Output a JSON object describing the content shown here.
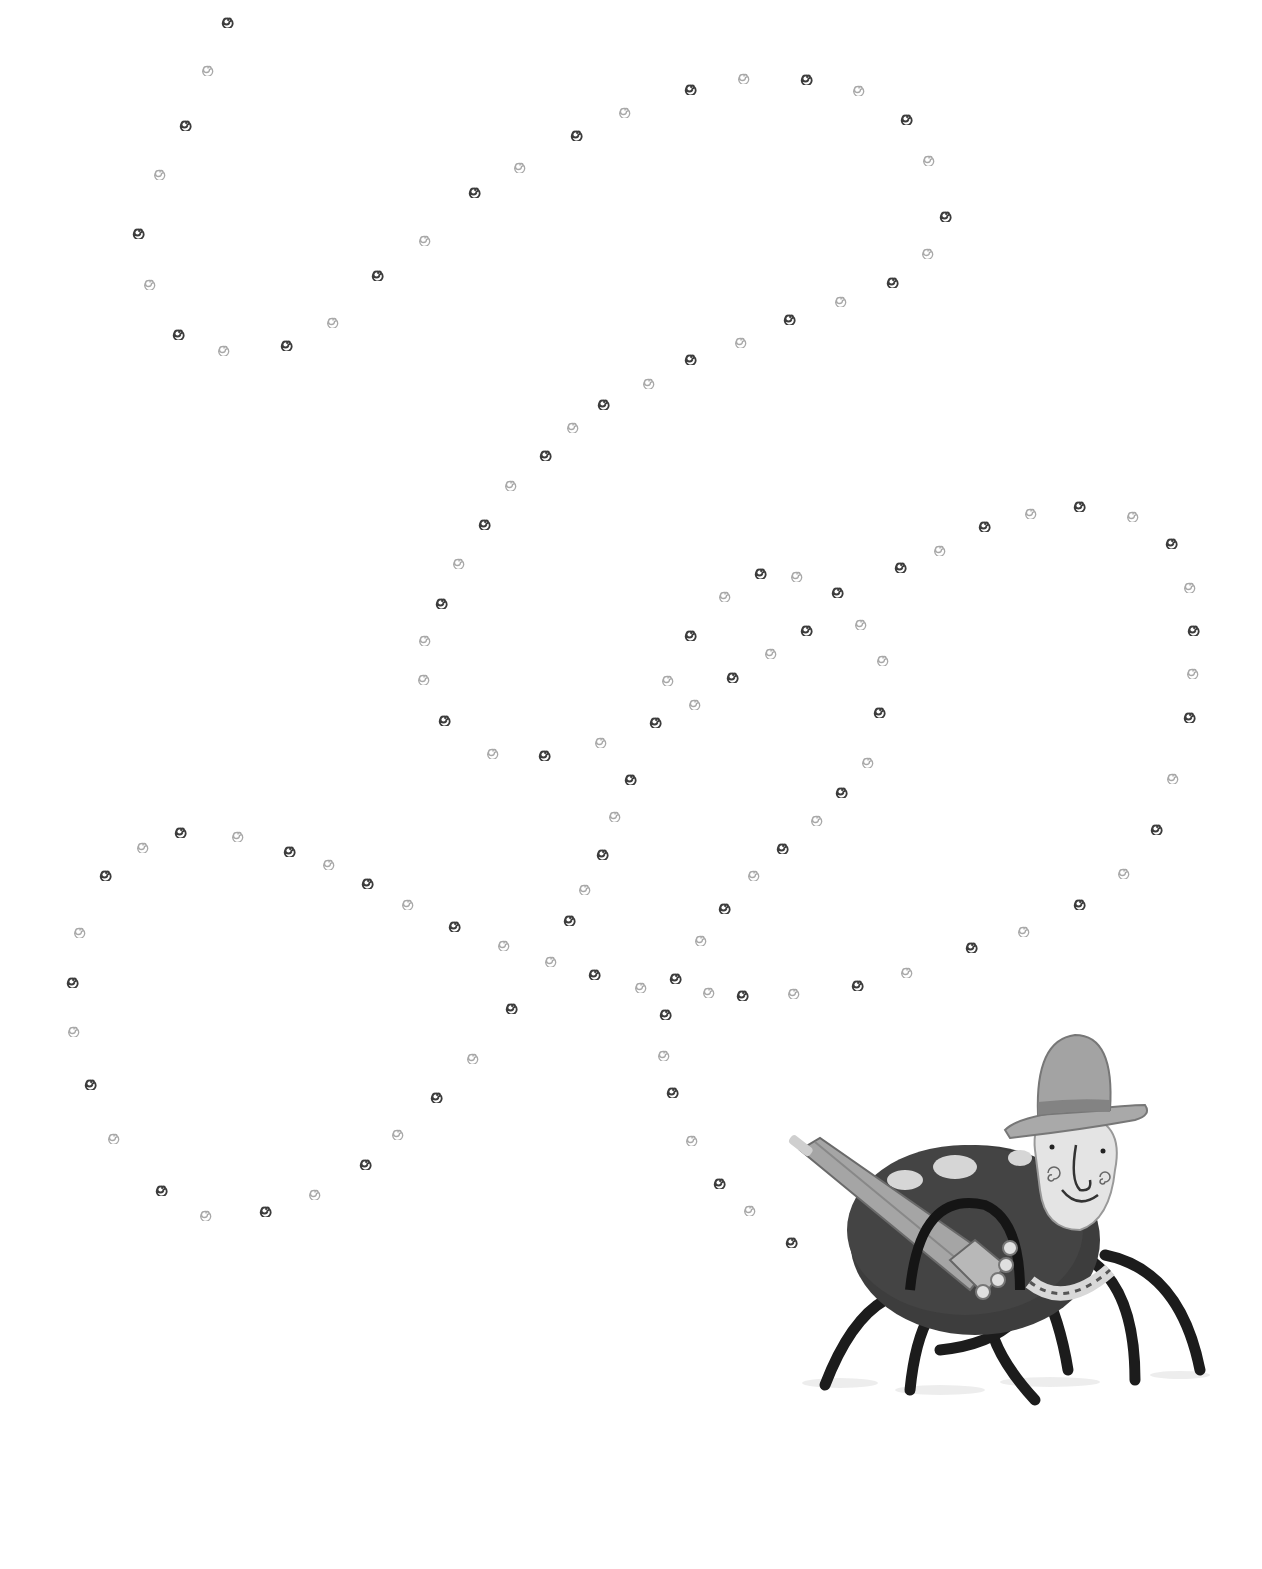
{
  "page": {
    "width": 1262,
    "height": 1569,
    "background": "#ffffff"
  },
  "illustration": {
    "subject": "spider wearing a bowler hat and holding a closed umbrella",
    "style": "grayscale painted children's book illustration",
    "colors": {
      "body": "#3a3a3a",
      "spots": "#d8d8d8",
      "legs": "#1a1a1a",
      "face": "#e6e6e6",
      "hat": "#9a9a9a",
      "hat_band": "#7a7a7a",
      "umbrella": "#9c9c9c"
    }
  },
  "trail": {
    "icon": "spiral-icon",
    "dark_color": "#3c3c3c",
    "light_color": "#a8a8a8",
    "points": [
      [
        228,
        20,
        1
      ],
      [
        208,
        68,
        0
      ],
      [
        186,
        123,
        1
      ],
      [
        160,
        172,
        0
      ],
      [
        139,
        231,
        1
      ],
      [
        150,
        282,
        0
      ],
      [
        179,
        332,
        1
      ],
      [
        224,
        348,
        0
      ],
      [
        287,
        343,
        1
      ],
      [
        333,
        320,
        0
      ],
      [
        378,
        273,
        1
      ],
      [
        425,
        238,
        0
      ],
      [
        475,
        190,
        1
      ],
      [
        520,
        165,
        0
      ],
      [
        577,
        133,
        1
      ],
      [
        625,
        110,
        0
      ],
      [
        691,
        87,
        1
      ],
      [
        744,
        76,
        0
      ],
      [
        807,
        77,
        1
      ],
      [
        859,
        88,
        0
      ],
      [
        907,
        117,
        1
      ],
      [
        929,
        158,
        0
      ],
      [
        946,
        214,
        1
      ],
      [
        928,
        251,
        0
      ],
      [
        893,
        280,
        1
      ],
      [
        841,
        299,
        0
      ],
      [
        790,
        317,
        1
      ],
      [
        741,
        340,
        0
      ],
      [
        691,
        357,
        1
      ],
      [
        649,
        381,
        0
      ],
      [
        604,
        402,
        1
      ],
      [
        573,
        425,
        0
      ],
      [
        546,
        453,
        1
      ],
      [
        511,
        483,
        0
      ],
      [
        485,
        522,
        1
      ],
      [
        459,
        561,
        0
      ],
      [
        442,
        601,
        1
      ],
      [
        425,
        638,
        0
      ],
      [
        424,
        677,
        0
      ],
      [
        445,
        718,
        1
      ],
      [
        493,
        751,
        0
      ],
      [
        545,
        753,
        1
      ],
      [
        601,
        740,
        0
      ],
      [
        656,
        720,
        1
      ],
      [
        695,
        702,
        0
      ],
      [
        733,
        675,
        1
      ],
      [
        771,
        651,
        0
      ],
      [
        807,
        628,
        1
      ],
      [
        861,
        622,
        0
      ],
      [
        838,
        590,
        1
      ],
      [
        797,
        574,
        0
      ],
      [
        761,
        571,
        1
      ],
      [
        725,
        594,
        0
      ],
      [
        691,
        633,
        1
      ],
      [
        668,
        678,
        0
      ],
      [
        631,
        777,
        1
      ],
      [
        615,
        814,
        0
      ],
      [
        603,
        852,
        1
      ],
      [
        585,
        887,
        0
      ],
      [
        570,
        918,
        1
      ],
      [
        551,
        959,
        0
      ],
      [
        512,
        1006,
        1
      ],
      [
        473,
        1056,
        0
      ],
      [
        437,
        1095,
        1
      ],
      [
        398,
        1132,
        0
      ],
      [
        366,
        1162,
        1
      ],
      [
        315,
        1192,
        0
      ],
      [
        266,
        1209,
        1
      ],
      [
        206,
        1213,
        0
      ],
      [
        162,
        1188,
        1
      ],
      [
        114,
        1136,
        0
      ],
      [
        91,
        1082,
        1
      ],
      [
        74,
        1029,
        0
      ],
      [
        73,
        980,
        1
      ],
      [
        80,
        930,
        0
      ],
      [
        106,
        873,
        1
      ],
      [
        143,
        845,
        0
      ],
      [
        181,
        830,
        1
      ],
      [
        238,
        834,
        0
      ],
      [
        290,
        849,
        1
      ],
      [
        329,
        862,
        0
      ],
      [
        368,
        881,
        1
      ],
      [
        408,
        902,
        0
      ],
      [
        455,
        924,
        1
      ],
      [
        504,
        943,
        0
      ],
      [
        595,
        972,
        1
      ],
      [
        641,
        985,
        0
      ],
      [
        676,
        976,
        1
      ],
      [
        709,
        990,
        0
      ],
      [
        743,
        993,
        1
      ],
      [
        794,
        991,
        0
      ],
      [
        858,
        983,
        1
      ],
      [
        907,
        970,
        0
      ],
      [
        972,
        945,
        1
      ],
      [
        1024,
        929,
        0
      ],
      [
        1080,
        902,
        1
      ],
      [
        1124,
        871,
        0
      ],
      [
        1157,
        827,
        1
      ],
      [
        1173,
        776,
        0
      ],
      [
        1190,
        715,
        1
      ],
      [
        1193,
        671,
        0
      ],
      [
        1194,
        628,
        1
      ],
      [
        1190,
        585,
        0
      ],
      [
        1172,
        541,
        1
      ],
      [
        1133,
        514,
        0
      ],
      [
        1080,
        504,
        1
      ],
      [
        1031,
        511,
        0
      ],
      [
        985,
        524,
        1
      ],
      [
        940,
        548,
        0
      ],
      [
        901,
        565,
        1
      ],
      [
        883,
        658,
        0
      ],
      [
        880,
        710,
        1
      ],
      [
        868,
        760,
        0
      ],
      [
        842,
        790,
        1
      ],
      [
        817,
        818,
        0
      ],
      [
        783,
        846,
        1
      ],
      [
        754,
        873,
        0
      ],
      [
        725,
        906,
        1
      ],
      [
        701,
        938,
        0
      ],
      [
        666,
        1012,
        1
      ],
      [
        664,
        1053,
        0
      ],
      [
        673,
        1090,
        1
      ],
      [
        692,
        1138,
        0
      ],
      [
        720,
        1181,
        1
      ],
      [
        750,
        1208,
        0
      ],
      [
        792,
        1240,
        1
      ]
    ]
  }
}
